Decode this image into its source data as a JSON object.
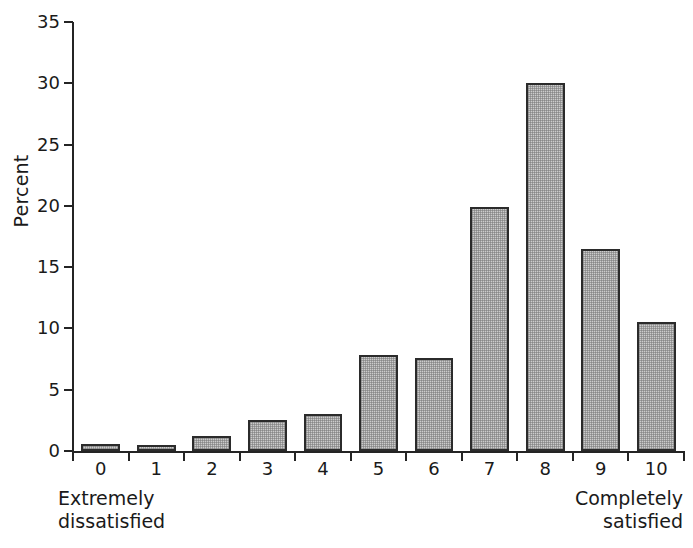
{
  "chart_data": {
    "type": "bar",
    "title": "",
    "subtitle": "",
    "xlabel": "",
    "ylabel": "Percent",
    "categories": [
      "0",
      "1",
      "2",
      "3",
      "4",
      "5",
      "6",
      "7",
      "8",
      "9",
      "10"
    ],
    "values": [
      0.6,
      0.5,
      1.2,
      2.5,
      3.0,
      7.8,
      7.6,
      19.9,
      30.0,
      16.5,
      10.5
    ],
    "ylim": [
      0,
      35
    ],
    "yticks": [
      0,
      5,
      10,
      15,
      20,
      25,
      30,
      35
    ],
    "ytick_labels": [
      "0",
      "5",
      "10",
      "15",
      "20",
      "25",
      "30",
      "35"
    ],
    "grid": false,
    "legend": "none",
    "annotations": [
      {
        "text": "Extremely\ndissatisfied",
        "position": "bottom-left"
      },
      {
        "text": "Completely\nsatisfied",
        "position": "bottom-right"
      }
    ],
    "colors": {
      "bar_fill": "#cccccc",
      "bar_border": "#2b2b2b",
      "axis": "#242424",
      "text": "#1a1a1a",
      "background": "#ffffff"
    }
  }
}
